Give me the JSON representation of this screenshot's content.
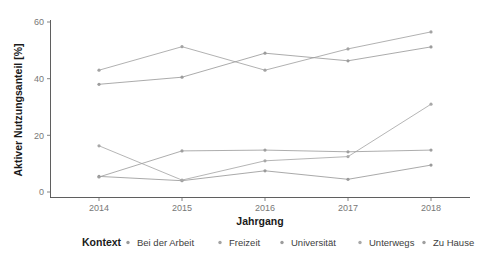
{
  "chart_data": {
    "type": "line",
    "title": "",
    "xlabel": "Jahrgang",
    "ylabel": "Aktiver Nutzungsanteil [%]",
    "x": [
      2014,
      2015,
      2016,
      2017,
      2018
    ],
    "xticklabels": [
      "2014",
      "2015",
      "2016",
      "2017",
      "2018"
    ],
    "yticks": [
      0,
      20,
      40,
      60
    ],
    "yticklabels": [
      "0",
      "20",
      "40",
      "60"
    ],
    "ylim": [
      0,
      62
    ],
    "grid": false,
    "legend_title": "Kontext",
    "legend_position": "bottom",
    "series": [
      {
        "name": "Bei der Arbeit",
        "color": "#9a9a9a",
        "values": [
          5.5,
          4.0,
          7.5,
          4.5,
          9.5
        ]
      },
      {
        "name": "Freizeit",
        "color": "#a3a3a3",
        "values": [
          43.0,
          51.3,
          43.0,
          50.5,
          56.5
        ]
      },
      {
        "name": "Universität",
        "color": "#9c9c9c",
        "values": [
          38.0,
          40.5,
          49.0,
          46.3,
          51.2
        ]
      },
      {
        "name": "Unterwegs",
        "color": "#a8a8a8",
        "values": [
          16.3,
          4.2,
          11.0,
          12.5,
          31.0
        ]
      },
      {
        "name": "Zu Hause",
        "color": "#9e9e9e",
        "values": [
          5.3,
          14.5,
          14.8,
          14.2,
          14.8
        ]
      }
    ]
  },
  "axes": {
    "y_axis_label": "Aktiver Nutzungsanteil [%]",
    "x_axis_label": "Jahrgang"
  },
  "legend": {
    "title": "Kontext",
    "items": [
      {
        "label": "Bei der Arbeit",
        "marker": "point-marker"
      },
      {
        "label": "Freizeit",
        "marker": "point-marker"
      },
      {
        "label": "Universität",
        "marker": "point-marker"
      },
      {
        "label": "Unterwegs",
        "marker": "point-marker"
      },
      {
        "label": "Zu Hause",
        "marker": "point-marker"
      }
    ]
  },
  "style": {
    "background": "#ffffff",
    "axis_color": "#4d4d4d",
    "tick_text_color": "#777777",
    "title_text_color": "#1a1a1a"
  }
}
